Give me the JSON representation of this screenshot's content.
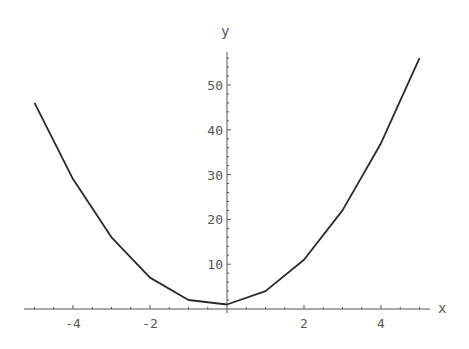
{
  "chart_data": {
    "type": "line",
    "title": "",
    "xlabel": "x",
    "ylabel": "y",
    "x": [
      -5,
      -4,
      -3,
      -2,
      -1,
      0,
      1,
      2,
      3,
      4,
      5
    ],
    "series": [
      {
        "name": "y",
        "values": [
          46,
          29,
          16,
          7,
          2,
          1,
          4,
          11,
          22,
          37,
          56
        ]
      }
    ],
    "xlim": [
      -5.2,
      5.0
    ],
    "ylim": [
      0,
      57
    ],
    "x_ticks": [
      -4,
      -2,
      2,
      4
    ],
    "x_tick_labels": [
      "-4",
      "-2",
      "2",
      "4"
    ],
    "y_ticks": [
      10,
      20,
      30,
      40,
      50
    ],
    "y_tick_labels": [
      "10",
      "20",
      "30",
      "40",
      "50"
    ],
    "grid": false,
    "legend": "none",
    "line_color": "#2a2a2a",
    "axis_color": "#555555"
  }
}
